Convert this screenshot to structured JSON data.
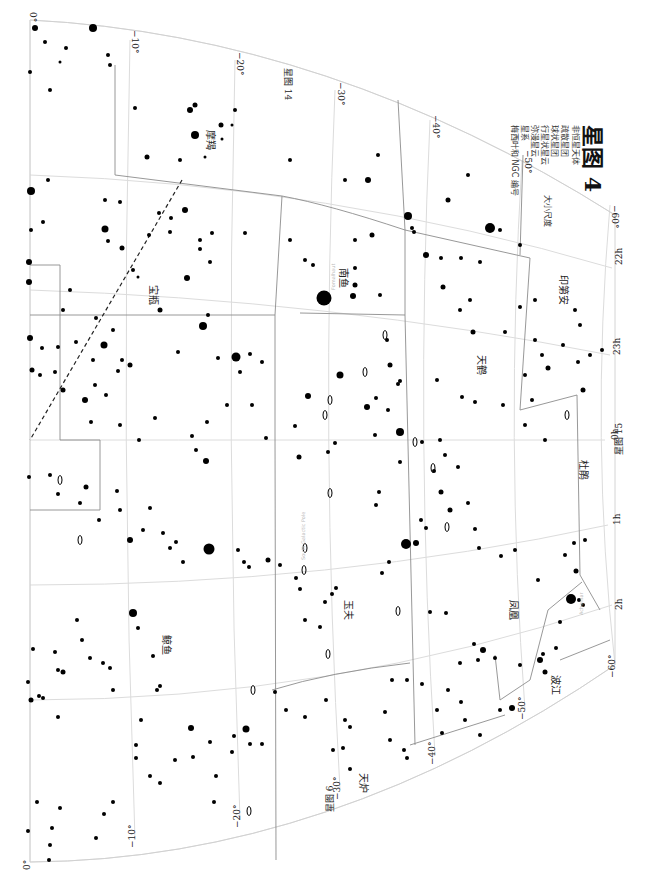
{
  "legend": {
    "title": "星图 4",
    "subtitle": "非恒星天体",
    "items": [
      {
        "symbol": "open-cluster",
        "label": "疏散星团"
      },
      {
        "symbol": "globular-cluster",
        "label": "球状星团"
      },
      {
        "symbol": "planetary-nebula",
        "label": "行星状星云"
      },
      {
        "symbol": "diffuse-nebula",
        "label": "弥漫星云"
      },
      {
        "symbol": "galaxy",
        "label": "星系"
      },
      {
        "symbol": "catalog-numbers",
        "label": "梅西叶和 NGC 编号"
      }
    ],
    "size_label": "大小尺度"
  },
  "edges": {
    "adjacent_top": "星图 14",
    "adjacent_right": "星图 15",
    "adjacent_bottom": "星图 6"
  },
  "dec_labels_top": [
    "0°",
    "−10°",
    "−20°",
    "−30°",
    "−40°",
    "−50°",
    "−60°"
  ],
  "dec_labels_bottom": [
    "0°",
    "−10°",
    "−20°",
    "−30°",
    "−40°",
    "−50°",
    "−60°"
  ],
  "ra_labels": [
    "22h",
    "23h",
    "0h",
    "1h",
    "2h"
  ],
  "constellations": [
    {
      "name": "摩羯",
      "x": 207,
      "y": 130
    },
    {
      "name": "宝瓶",
      "x": 150,
      "y": 285
    },
    {
      "name": "南鱼",
      "x": 340,
      "y": 268
    },
    {
      "name": "天鹤",
      "x": 478,
      "y": 355
    },
    {
      "name": "印第安",
      "x": 560,
      "y": 275
    },
    {
      "name": "杜鹃",
      "x": 580,
      "y": 460
    },
    {
      "name": "玉夫",
      "x": 345,
      "y": 600
    },
    {
      "name": "凤凰",
      "x": 510,
      "y": 600
    },
    {
      "name": "鲸鱼",
      "x": 163,
      "y": 635
    },
    {
      "name": "天炉",
      "x": 360,
      "y": 773
    },
    {
      "name": "波江",
      "x": 552,
      "y": 675
    }
  ],
  "annotations": [
    {
      "text": "South Galactic Pole",
      "x": 305,
      "y": 560
    },
    {
      "text": "Fomalhaut",
      "x": 335,
      "y": 290
    },
    {
      "text": "Achernar",
      "x": 583,
      "y": 615
    }
  ],
  "stars": [
    [
      35,
      28,
      3
    ],
    [
      93,
      28,
      4
    ],
    [
      45,
      42,
      2
    ],
    [
      66,
      48,
      2
    ],
    [
      108,
      55,
      2
    ],
    [
      30,
      72,
      2
    ],
    [
      60,
      62,
      1.5
    ],
    [
      50,
      90,
      2
    ],
    [
      110,
      65,
      2
    ],
    [
      135,
      108,
      2
    ],
    [
      190,
      110,
      3
    ],
    [
      195,
      135,
      4
    ],
    [
      221,
      125,
      2.5
    ],
    [
      222,
      139,
      1.5
    ],
    [
      205,
      157,
      1.5
    ],
    [
      147,
      157,
      2.5
    ],
    [
      180,
      160,
      2
    ],
    [
      195,
      105,
      2.5
    ],
    [
      235,
      110,
      2
    ],
    [
      232,
      125,
      1.5
    ],
    [
      31,
      191,
      4
    ],
    [
      48,
      180,
      2
    ],
    [
      31,
      230,
      2
    ],
    [
      43,
      222,
      2
    ],
    [
      105,
      200,
      2
    ],
    [
      120,
      202,
      2
    ],
    [
      185,
      210,
      3
    ],
    [
      149,
      235,
      2
    ],
    [
      170,
      232,
      2
    ],
    [
      200,
      240,
      2
    ],
    [
      212,
      233,
      2
    ],
    [
      245,
      233,
      2
    ],
    [
      105,
      229,
      3.5
    ],
    [
      108,
      241,
      2
    ],
    [
      133,
      270,
      2
    ],
    [
      138,
      277,
      1.5
    ],
    [
      122,
      248,
      2.5
    ],
    [
      159,
      213,
      2
    ],
    [
      171,
      218,
      2
    ],
    [
      210,
      262,
      2
    ],
    [
      160,
      310,
      2.5
    ],
    [
      187,
      278,
      3
    ],
    [
      200,
      249,
      2
    ],
    [
      29,
      262,
      3
    ],
    [
      29,
      282,
      3
    ],
    [
      70,
      290,
      2
    ],
    [
      63,
      310,
      2
    ],
    [
      96,
      318,
      2
    ],
    [
      113,
      330,
      2
    ],
    [
      42,
      348,
      2
    ],
    [
      76,
      342,
      2
    ],
    [
      104,
      345,
      3.5
    ],
    [
      122,
      360,
      2
    ],
    [
      130,
      365,
      2.5
    ],
    [
      290,
      160,
      2
    ],
    [
      290,
      240,
      2
    ],
    [
      305,
      260,
      2
    ],
    [
      313,
      265,
      2
    ],
    [
      324,
      298,
      7.5
    ],
    [
      353,
      296,
      3
    ],
    [
      355,
      285,
      2.5
    ],
    [
      355,
      268,
      2
    ],
    [
      355,
      240,
      2
    ],
    [
      345,
      180,
      2
    ],
    [
      368,
      180,
      3
    ],
    [
      378,
      155,
      2
    ],
    [
      372,
      235,
      2.5
    ],
    [
      380,
      295,
      2
    ],
    [
      387,
      340,
      2
    ],
    [
      408,
      216,
      4
    ],
    [
      412,
      228,
      2
    ],
    [
      414,
      232,
      2
    ],
    [
      426,
      255,
      3
    ],
    [
      448,
      200,
      2.5
    ],
    [
      468,
      175,
      2
    ],
    [
      490,
      228,
      5
    ],
    [
      500,
      230,
      2
    ],
    [
      520,
      245,
      2
    ],
    [
      520,
      307,
      2
    ],
    [
      460,
      310,
      2
    ],
    [
      470,
      300,
      2
    ],
    [
      441,
      258,
      2
    ],
    [
      443,
      287,
      2.5
    ],
    [
      461,
      258,
      2
    ],
    [
      480,
      262,
      2
    ],
    [
      473,
      332,
      2.5
    ],
    [
      505,
      332,
      2
    ],
    [
      535,
      300,
      2
    ],
    [
      575,
      310,
      2
    ],
    [
      580,
      325,
      2
    ],
    [
      390,
      365,
      2.5
    ],
    [
      437,
      380,
      2
    ],
    [
      462,
      397,
      2
    ],
    [
      475,
      402,
      2
    ],
    [
      503,
      405,
      2
    ],
    [
      525,
      425,
      2
    ],
    [
      545,
      440,
      2
    ],
    [
      583,
      390,
      2.5
    ],
    [
      340,
      375,
      3.5
    ],
    [
      376,
      398,
      2
    ],
    [
      388,
      410,
      2
    ],
    [
      398,
      384,
      2
    ],
    [
      400,
      432,
      4
    ],
    [
      422,
      442,
      2
    ],
    [
      440,
      440,
      2
    ],
    [
      445,
      455,
      2
    ],
    [
      434,
      471,
      2
    ],
    [
      525,
      375,
      2
    ],
    [
      532,
      400,
      2
    ],
    [
      535,
      340,
      2
    ],
    [
      542,
      355,
      2
    ],
    [
      548,
      368,
      2.5
    ],
    [
      563,
      345,
      2
    ],
    [
      578,
      362,
      2
    ],
    [
      590,
      355,
      2
    ],
    [
      602,
      350,
      2
    ],
    [
      30,
      338,
      3
    ],
    [
      32,
      370,
      2.5
    ],
    [
      40,
      375,
      2
    ],
    [
      55,
      372,
      2
    ],
    [
      58,
      347,
      2
    ],
    [
      63,
      390,
      2.5
    ],
    [
      93,
      360,
      2
    ],
    [
      95,
      385,
      2
    ],
    [
      85,
      400,
      3
    ],
    [
      91,
      422,
      2
    ],
    [
      118,
      371,
      2
    ],
    [
      106,
      395,
      2
    ],
    [
      178,
      352,
      2
    ],
    [
      203,
      326,
      4
    ],
    [
      208,
      315,
      2
    ],
    [
      236,
      357,
      4.5
    ],
    [
      240,
      372,
      2
    ],
    [
      218,
      358,
      2
    ],
    [
      250,
      354,
      2
    ],
    [
      262,
      362,
      2
    ],
    [
      155,
      418,
      2
    ],
    [
      120,
      425,
      2
    ],
    [
      139,
      440,
      2
    ],
    [
      192,
      436,
      2
    ],
    [
      196,
      450,
      2
    ],
    [
      207,
      422,
      2
    ],
    [
      206,
      461,
      3
    ],
    [
      227,
      405,
      2
    ],
    [
      252,
      405,
      2
    ],
    [
      266,
      438,
      2
    ],
    [
      295,
      426,
      2
    ],
    [
      299,
      457,
      2.5
    ],
    [
      308,
      396,
      3
    ],
    [
      335,
      443,
      2
    ],
    [
      328,
      452,
      2
    ],
    [
      367,
      407,
      3
    ],
    [
      375,
      435,
      2
    ],
    [
      400,
      381,
      2
    ],
    [
      400,
      462,
      2
    ],
    [
      29,
      477,
      2
    ],
    [
      50,
      475,
      2
    ],
    [
      58,
      494,
      2
    ],
    [
      80,
      503,
      2
    ],
    [
      86,
      487,
      2.5
    ],
    [
      117,
      491,
      2
    ],
    [
      120,
      510,
      2
    ],
    [
      99,
      520,
      2
    ],
    [
      130,
      540,
      3
    ],
    [
      143,
      530,
      2
    ],
    [
      150,
      508,
      2
    ],
    [
      163,
      533,
      2
    ],
    [
      170,
      548,
      2
    ],
    [
      176,
      542,
      2
    ],
    [
      183,
      562,
      2
    ],
    [
      209,
      549,
      5.5
    ],
    [
      238,
      550,
      2
    ],
    [
      244,
      562,
      2
    ],
    [
      249,
      567,
      2
    ],
    [
      268,
      560,
      2.5
    ],
    [
      280,
      565,
      2
    ],
    [
      296,
      578,
      2
    ],
    [
      300,
      589,
      2
    ],
    [
      305,
      620,
      2
    ],
    [
      320,
      627,
      2
    ],
    [
      325,
      602,
      2
    ],
    [
      332,
      594,
      2
    ],
    [
      336,
      588,
      2
    ],
    [
      382,
      573,
      2
    ],
    [
      389,
      562,
      2
    ],
    [
      376,
      505,
      2
    ],
    [
      379,
      492,
      2
    ],
    [
      406,
      544,
      5
    ],
    [
      416,
      543,
      3
    ],
    [
      421,
      520,
      2
    ],
    [
      426,
      528,
      2
    ],
    [
      441,
      492,
      2.5
    ],
    [
      450,
      510,
      2.5
    ],
    [
      458,
      467,
      2
    ],
    [
      468,
      503,
      2
    ],
    [
      475,
      529,
      2
    ],
    [
      479,
      548,
      2
    ],
    [
      501,
      556,
      2
    ],
    [
      515,
      550,
      2
    ],
    [
      538,
      580,
      2
    ],
    [
      565,
      555,
      2
    ],
    [
      576,
      571,
      2.5
    ],
    [
      574,
      543,
      2
    ],
    [
      585,
      540,
      2
    ],
    [
      483,
      650,
      3
    ],
    [
      430,
      612,
      2
    ],
    [
      446,
      613,
      2
    ],
    [
      474,
      644,
      2
    ],
    [
      495,
      658,
      2
    ],
    [
      520,
      665,
      2
    ],
    [
      571,
      599,
      5
    ],
    [
      579,
      600,
      2
    ],
    [
      583,
      605,
      2
    ],
    [
      560,
      622,
      2
    ],
    [
      556,
      648,
      2
    ],
    [
      540,
      660,
      3
    ],
    [
      543,
      654,
      2
    ],
    [
      545,
      672,
      2.5
    ],
    [
      33,
      649,
      2
    ],
    [
      28,
      682,
      2
    ],
    [
      31,
      700,
      2.5
    ],
    [
      39,
      696,
      2
    ],
    [
      58,
      670,
      2
    ],
    [
      55,
      652,
      2
    ],
    [
      63,
      672,
      2.5
    ],
    [
      58,
      717,
      2
    ],
    [
      43,
      698,
      2
    ],
    [
      77,
      620,
      2
    ],
    [
      82,
      640,
      2
    ],
    [
      90,
      658,
      2
    ],
    [
      103,
      663,
      2
    ],
    [
      110,
      668,
      2
    ],
    [
      133,
      613,
      4
    ],
    [
      138,
      628,
      2
    ],
    [
      141,
      720,
      2
    ],
    [
      136,
      745,
      2
    ],
    [
      153,
      656,
      2
    ],
    [
      157,
      690,
      2
    ],
    [
      160,
      686,
      2
    ],
    [
      113,
      690,
      2
    ],
    [
      136,
      758,
      2
    ],
    [
      150,
      776,
      2
    ],
    [
      160,
      783,
      2
    ],
    [
      175,
      760,
      2
    ],
    [
      216,
      776,
      2
    ],
    [
      37,
      802,
      2
    ],
    [
      28,
      831,
      2
    ],
    [
      50,
      845,
      2
    ],
    [
      49,
      860,
      2
    ],
    [
      52,
      828,
      2
    ],
    [
      60,
      808,
      2
    ],
    [
      96,
      838,
      2
    ],
    [
      104,
      814,
      2
    ],
    [
      113,
      802,
      2
    ],
    [
      191,
      728,
      3
    ],
    [
      193,
      757,
      2
    ],
    [
      210,
      742,
      2
    ],
    [
      214,
      802,
      2
    ],
    [
      232,
      752,
      2
    ],
    [
      234,
      736,
      2
    ],
    [
      246,
      729,
      3.5
    ],
    [
      250,
      744,
      2
    ],
    [
      262,
      744,
      2
    ],
    [
      275,
      692,
      2
    ],
    [
      286,
      710,
      2
    ],
    [
      305,
      717,
      2
    ],
    [
      326,
      700,
      2
    ],
    [
      345,
      720,
      2
    ],
    [
      333,
      750,
      2
    ],
    [
      350,
      769,
      2
    ],
    [
      343,
      748,
      2
    ],
    [
      350,
      727,
      2
    ],
    [
      392,
      680,
      2
    ],
    [
      385,
      712,
      2
    ],
    [
      390,
      740,
      2
    ],
    [
      407,
      680,
      2
    ],
    [
      422,
      684,
      2
    ],
    [
      437,
      710,
      2
    ],
    [
      442,
      733,
      2
    ],
    [
      404,
      750,
      2
    ],
    [
      407,
      758,
      2
    ],
    [
      478,
      660,
      2
    ],
    [
      460,
      663,
      2
    ],
    [
      448,
      690,
      2
    ],
    [
      461,
      702,
      2
    ],
    [
      465,
      720,
      2
    ],
    [
      500,
      710,
      2
    ],
    [
      480,
      735,
      2
    ],
    [
      512,
      708,
      3
    ]
  ],
  "galaxy_marks": [
    [
      60,
      480
    ],
    [
      80,
      540
    ],
    [
      253,
      690
    ],
    [
      328,
      654
    ],
    [
      398,
      611
    ],
    [
      447,
      527
    ],
    [
      415,
      442
    ],
    [
      325,
      415
    ],
    [
      330,
      400
    ],
    [
      304,
      570
    ],
    [
      385,
      335
    ],
    [
      365,
      372
    ],
    [
      433,
      468
    ],
    [
      567,
      415
    ],
    [
      330,
      493
    ],
    [
      305,
      548
    ],
    [
      249,
      811
    ]
  ],
  "colors": {
    "grid": "#dcdcdc",
    "boundary": "#8c8c8c",
    "ecliptic": "#222222",
    "star": "#000000"
  }
}
